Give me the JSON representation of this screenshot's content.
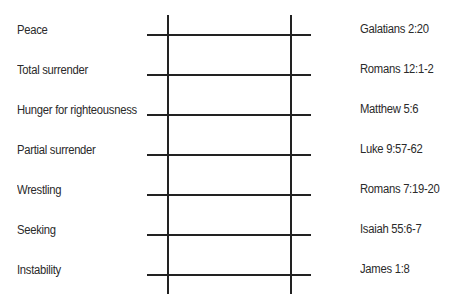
{
  "ladder": {
    "rungs": [
      {
        "stage": "Peace",
        "reference": "Galatians 2:20"
      },
      {
        "stage": "Total surrender",
        "reference": "Romans 12:1-2"
      },
      {
        "stage": "Hunger for righteousness",
        "reference": "Matthew 5:6"
      },
      {
        "stage": "Partial surrender",
        "reference": "Luke 9:57-62"
      },
      {
        "stage": "Wrestling",
        "reference": "Romans 7:19-20"
      },
      {
        "stage": "Seeking",
        "reference": "Isaiah 55:6-7"
      },
      {
        "stage": "Instability",
        "reference": "James 1:8"
      }
    ]
  }
}
